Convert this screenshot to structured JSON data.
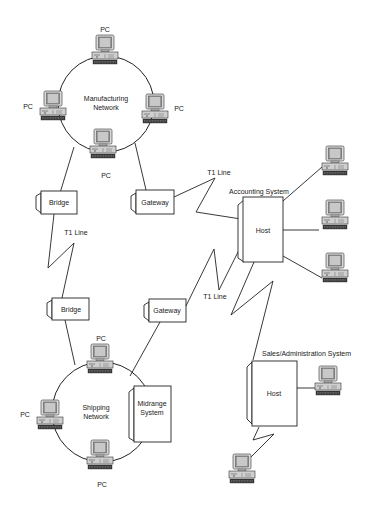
{
  "diagram": {
    "type": "network-topology",
    "networks": {
      "manufacturing": {
        "label_line1": "Manufacturing",
        "label_line2": "Network",
        "pc_labels": [
          "PC",
          "PC",
          "PC",
          "PC"
        ]
      },
      "shipping": {
        "label_line1": "Shipping",
        "label_line2": "Network",
        "pc_labels": [
          "PC",
          "PC",
          "PC"
        ],
        "midrange_line1": "Midrange",
        "midrange_line2": "System"
      }
    },
    "devices": {
      "bridge_top": "Bridge",
      "bridge_bottom": "Bridge",
      "gateway_top": "Gateway",
      "gateway_bottom": "Gateway"
    },
    "links": {
      "t1_bridge": "T1 Line",
      "t1_gateway_top": "T1 Line",
      "t1_gateway_bottom": "T1 Line"
    },
    "accounting": {
      "title": "Accounting System",
      "host": "Host"
    },
    "sales": {
      "title": "Sales/Administration System",
      "host": "Host"
    }
  }
}
